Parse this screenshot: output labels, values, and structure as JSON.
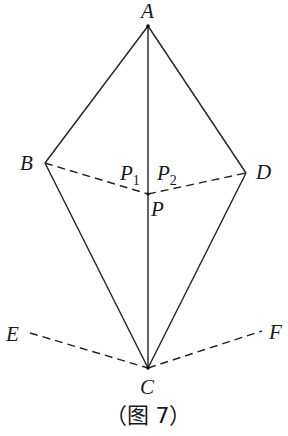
{
  "diagram": {
    "caption": "（图 7）",
    "points": {
      "A": {
        "label": "A",
        "x": 148,
        "y": 26
      },
      "B": {
        "label": "B",
        "x": 45,
        "y": 163
      },
      "C": {
        "label": "C",
        "x": 148,
        "y": 368
      },
      "D": {
        "label": "D",
        "x": 246,
        "y": 173
      },
      "P": {
        "label": "P",
        "x": 148,
        "y": 194
      },
      "E": {
        "label": "E",
        "x": 30,
        "y": 333
      },
      "F": {
        "label": "F",
        "x": 262,
        "y": 331
      }
    },
    "labels": {
      "A": "A",
      "B": "B",
      "C": "C",
      "D": "D",
      "P": "P",
      "E": "E",
      "F": "F",
      "P1_main": "P",
      "P1_sub": "1",
      "P2_main": "P",
      "P2_sub": "2"
    },
    "solid_segments": [
      "AB",
      "AD",
      "BC",
      "DC",
      "AC"
    ],
    "dashed_segments": [
      "BP",
      "PD",
      "EC",
      "CF"
    ]
  }
}
